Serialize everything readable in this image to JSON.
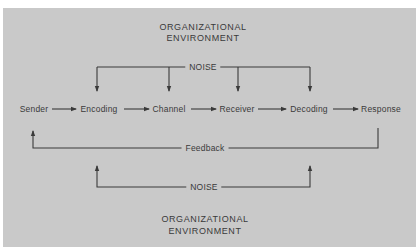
{
  "diagram": {
    "top_environment": {
      "line1": "ORGANIZATIONAL",
      "line2": "ENVIRONMENT"
    },
    "bottom_environment": {
      "line1": "ORGANIZATIONAL",
      "line2": "ENVIRONMENT"
    },
    "top_noise_label": "NOISE",
    "bottom_noise_label": "NOISE",
    "feedback_label": "Feedback",
    "process_steps": [
      "Sender",
      "Encoding",
      "Channel",
      "Receiver",
      "Decoding",
      "Response"
    ],
    "noise_targets_top": [
      "Encoding",
      "Channel",
      "Receiver",
      "Decoding"
    ],
    "noise_targets_bottom": [
      "Encoding",
      "Decoding"
    ],
    "feedback_from": "Response",
    "feedback_to": "Sender"
  },
  "colors": {
    "background": "#c9c9c9",
    "line": "#3a3a3a",
    "text": "#3a3a3a"
  }
}
